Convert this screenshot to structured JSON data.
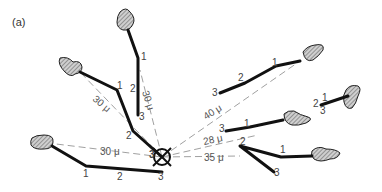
{
  "figure": {
    "panel_label": "(a)",
    "center_marker": "crossed-circle",
    "center_label": "3",
    "distances": [
      {
        "label": "30 μ",
        "cell": "upper-left"
      },
      {
        "label": "30 μ",
        "cell": "top"
      },
      {
        "label": "30 μ",
        "cell": "left"
      },
      {
        "label": "40 μ",
        "cell": "upper-right"
      },
      {
        "label": "28 μ",
        "cell": "right"
      },
      {
        "label": "35 μ",
        "cell": "lower-right"
      }
    ],
    "trajectories": [
      {
        "cell": "top",
        "labels": [
          "1",
          "2",
          "3"
        ]
      },
      {
        "cell": "upper-left",
        "labels": [
          "1",
          "2",
          "3"
        ]
      },
      {
        "cell": "left",
        "labels": [
          "1",
          "2",
          "3"
        ]
      },
      {
        "cell": "upper-right",
        "labels": [
          "1",
          "2",
          "3"
        ]
      },
      {
        "cell": "far-right",
        "labels": [
          "1",
          "2",
          "3"
        ]
      },
      {
        "cell": "right",
        "labels": [
          "1",
          "3"
        ]
      },
      {
        "cell": "lower-right",
        "labels": [
          "1",
          "2",
          "3"
        ]
      }
    ]
  }
}
